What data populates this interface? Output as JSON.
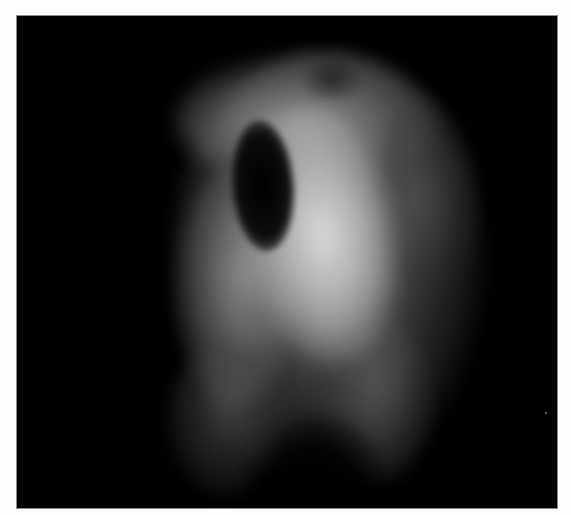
{
  "image": {
    "kind": "grayscale fluorescence micrograph",
    "subject": "single cell with dark oval nucleus",
    "background_color": "#000000",
    "border_color": "#fdfdfd",
    "signal_color": "#e1e1e1"
  }
}
